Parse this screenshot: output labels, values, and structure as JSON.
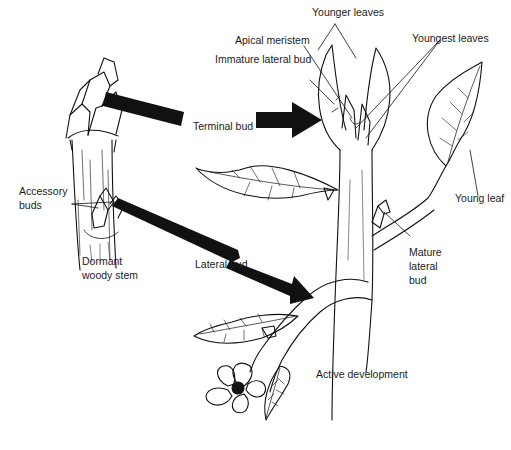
{
  "diagram": {
    "colors": {
      "ink": "#111111",
      "background": "#ffffff",
      "label": "#1a1a1a"
    },
    "panels": [
      {
        "id": "dormant",
        "caption": "Dormant woody stem"
      },
      {
        "id": "active",
        "caption": "Active development"
      }
    ],
    "labels": {
      "younger_leaves": "Younger leaves",
      "apical_meristem": "Apical meristem",
      "youngest_leaves": "Youngest leaves",
      "immature_lateral_bud": "Immature lateral bud",
      "terminal_bud": "Terminal bud",
      "young_leaf": "Young leaf",
      "accessory_buds_1": "Accessory",
      "accessory_buds_2": "buds",
      "dormant_1": "Dormant",
      "dormant_2": "woody stem",
      "lateral_bud": "Lateral bud",
      "mature_lateral_bud_1": "Mature",
      "mature_lateral_bud_2": "lateral",
      "mature_lateral_bud_3": "bud",
      "active_development": "Active development"
    },
    "arrows": [
      {
        "from": "dormant terminal bud",
        "to": "active terminal bud",
        "label": "Terminal bud"
      },
      {
        "from": "dormant lateral bud",
        "to": "active lateral shoot",
        "label": "Lateral bud"
      }
    ]
  }
}
